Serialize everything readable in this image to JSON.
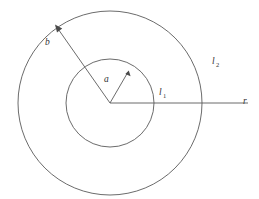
{
  "figure": {
    "background_color": "#ffffff",
    "stroke_color": "#5a5a5a",
    "text_color": "#333333",
    "labels": {
      "inner_radius": "a",
      "outer_radius": "b",
      "inner_region": "l",
      "inner_region_subscript": "1",
      "outer_region": "l",
      "outer_region_subscript": "2",
      "radial_axis": "r"
    },
    "geometry": {
      "center_x": 110,
      "center_y": 103,
      "inner_circle_radius": 44,
      "outer_circle_radius": 92,
      "radial_axis_end_x": 248,
      "arrow_a_tip_x": 128,
      "arrow_a_tip_y": 72,
      "arrow_b_tip_x": 56,
      "arrow_b_tip_y": 26
    },
    "label_positions": {
      "a": {
        "x": 104,
        "y": 82
      },
      "b": {
        "x": 45,
        "y": 45
      },
      "l1": {
        "x": 159,
        "y": 95
      },
      "l2": {
        "x": 212,
        "y": 64
      },
      "r": {
        "x": 243,
        "y": 104
      }
    }
  }
}
